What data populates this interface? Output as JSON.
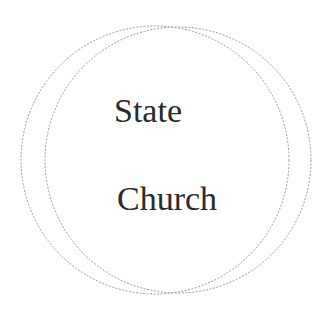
{
  "diagram": {
    "type": "venn",
    "circles": [
      {
        "name": "left-circle",
        "cx": 155,
        "cy": 160,
        "r": 134
      },
      {
        "name": "right-circle",
        "cx": 178,
        "cy": 160,
        "r": 133
      }
    ],
    "stroke_color": "#9a9a9a",
    "labels": {
      "state": "State",
      "church": "Church"
    }
  }
}
